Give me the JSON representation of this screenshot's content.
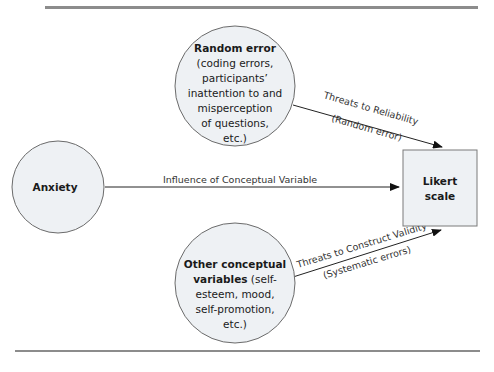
{
  "diagram": {
    "rules": {
      "color": "#8c8c8c"
    },
    "nodes": {
      "random_error": {
        "title": "Random error",
        "lines": [
          "(coding errors,",
          "participants’",
          "inattention to and",
          "misperception",
          "of questions,",
          "etc.)"
        ]
      },
      "anxiety": {
        "title": "Anxiety"
      },
      "other_variables": {
        "title_line1": "Other conceptual",
        "title_line2_bold": "variables",
        "title_line2_rest": " (self-",
        "lines": [
          "esteem, mood,",
          "self-promotion,",
          "etc.)"
        ]
      },
      "likert": {
        "line1": "Likert",
        "line2": "scale"
      }
    },
    "edges": {
      "reliability": {
        "label": "Threats to Reliability",
        "sublabel": "(Random error)"
      },
      "influence": {
        "label": "Influence of Conceptual Variable"
      },
      "validity": {
        "label": "Threats to Construct Validity",
        "sublabel": "(Systematic errors)"
      }
    },
    "colors": {
      "node_fill": "#eef1f4",
      "node_stroke": "#6b6b6b",
      "edge": "#222222"
    }
  }
}
